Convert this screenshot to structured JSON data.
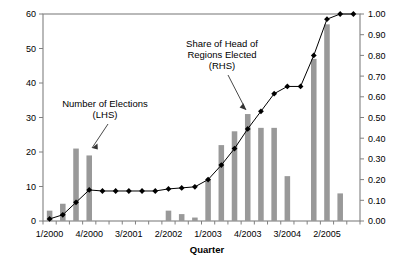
{
  "chart_data": {
    "type": "bar",
    "title": "",
    "xlabel": "Quarter",
    "ylabel": "",
    "grid": false,
    "legend_position": "none",
    "x_tick_labels": [
      "1/2000",
      "4/2000",
      "3/2001",
      "2/2002",
      "1/2003",
      "4/2003",
      "3/2004",
      "2/2005"
    ],
    "x_tick_indices": [
      0,
      3,
      6,
      9,
      12,
      15,
      18,
      21
    ],
    "categories": [
      "1/2000",
      "2/2000",
      "3/2000",
      "4/2000",
      "1/2001",
      "2/2001",
      "3/2001",
      "4/2001",
      "1/2002",
      "2/2002",
      "3/2002",
      "4/2002",
      "1/2003",
      "2/2003",
      "3/2003",
      "4/2003",
      "1/2004",
      "2/2004",
      "3/2004",
      "4/2004",
      "1/2005",
      "2/2005",
      "3/2005",
      "4/2005"
    ],
    "left_axis": {
      "label": "Number of Elections (LHS)",
      "ylim": [
        0,
        60
      ],
      "ticks": [
        0,
        10,
        20,
        30,
        40,
        50,
        60
      ],
      "tick_labels": [
        "0",
        "10",
        "20",
        "30",
        "40",
        "50",
        "60"
      ]
    },
    "right_axis": {
      "label": "Share of Head of Regions Elected (RHS)",
      "ylim": [
        0,
        1.0
      ],
      "ticks": [
        0.0,
        0.1,
        0.2,
        0.3,
        0.4,
        0.5,
        0.6,
        0.7,
        0.8,
        0.9,
        1.0
      ],
      "tick_labels": [
        "0.00",
        "0.10",
        "0.20",
        "0.30",
        "0.40",
        "0.50",
        "0.60",
        "0.70",
        "0.80",
        "0.90",
        "1.00"
      ]
    },
    "series": [
      {
        "name": "Number of Elections",
        "axis": "left",
        "type": "bar",
        "color": "#999999",
        "values": [
          3,
          5,
          21,
          19,
          0,
          0,
          0,
          0,
          0,
          3,
          2,
          1,
          12,
          22,
          26,
          31,
          27,
          27,
          13,
          0,
          47,
          57,
          8,
          0
        ]
      },
      {
        "name": "Share of Head of Regions Elected",
        "axis": "right",
        "type": "line",
        "color": "#000000",
        "marker": "diamond",
        "values": [
          0.01,
          0.03,
          0.09,
          0.15,
          0.145,
          0.145,
          0.145,
          0.145,
          0.145,
          0.155,
          0.16,
          0.165,
          0.2,
          0.27,
          0.35,
          0.445,
          0.53,
          0.615,
          0.65,
          0.65,
          0.8,
          0.975,
          1.0,
          1.0
        ]
      }
    ],
    "annotations": [
      {
        "name": "number-of-elections",
        "lines": [
          "Number of Elections",
          "(LHS)"
        ],
        "target": "bar at 4/2000"
      },
      {
        "name": "share-of-head-of-regions-elected",
        "lines": [
          "Share of Head of",
          "Regions Elected",
          "(RHS)"
        ],
        "target": "line point at 1/2004"
      }
    ]
  }
}
